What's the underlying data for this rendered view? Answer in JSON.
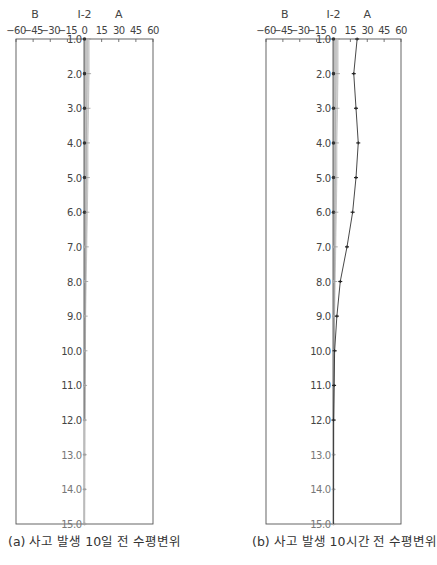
{
  "chart_data": [
    {
      "type": "line",
      "title": "(a) 사고 발생 10일 전 수평변위",
      "orientation": "vertical-profile",
      "xlabel_left": "B",
      "xlabel_center": "I-2",
      "xlabel_right": "A",
      "x_ticks": [
        "-60",
        "-45",
        "-30",
        "-15",
        "0",
        "15",
        "30",
        "45",
        "60"
      ],
      "xlim": [
        -60,
        60
      ],
      "y_ticks": [
        "1.0",
        "2.0",
        "3.0",
        "4.0",
        "5.0",
        "6.0",
        "7.0",
        "8.0",
        "9.0",
        "10.0",
        "11.0",
        "12.0",
        "13.0",
        "14.0",
        "15.0"
      ],
      "ylim": [
        1,
        15
      ],
      "ylabel": "Depth (m)",
      "depths": [
        1,
        2,
        3,
        4,
        5,
        6,
        7,
        8,
        9,
        10,
        11,
        12,
        13,
        14,
        15
      ],
      "series": [
        {
          "name": "I-2 baseline",
          "values": [
            0,
            0,
            0,
            0,
            0,
            0,
            0,
            0,
            0,
            0,
            0,
            0,
            0,
            0,
            0
          ]
        },
        {
          "name": "I-2 band",
          "values": [
            4,
            4,
            3.5,
            3,
            3,
            2.5,
            2,
            1.5,
            1,
            0.8,
            0.5,
            0.3,
            0.2,
            0.1,
            0
          ]
        }
      ]
    },
    {
      "type": "line",
      "title": "(b) 사고 발생 10시간 전 수평변위",
      "orientation": "vertical-profile",
      "xlabel_left": "B",
      "xlabel_center": "I-2",
      "xlabel_right": "A",
      "x_ticks": [
        "-60",
        "-45",
        "-30",
        "-15",
        "0",
        "15",
        "30",
        "45",
        "60"
      ],
      "xlim": [
        -60,
        60
      ],
      "y_ticks": [
        "1.0",
        "2.0",
        "3.0",
        "4.0",
        "5.0",
        "6.0",
        "7.0",
        "8.0",
        "9.0",
        "10.0",
        "11.0",
        "12.0",
        "13.0",
        "14.0",
        "15.0"
      ],
      "ylim": [
        1,
        15
      ],
      "ylabel": "Depth (m)",
      "depths": [
        1,
        2,
        3,
        4,
        5,
        6,
        7,
        8,
        9,
        10,
        11,
        12,
        13,
        14,
        15
      ],
      "series": [
        {
          "name": "I-2 baseline",
          "values": [
            0,
            0,
            0,
            0,
            0,
            0,
            0,
            0,
            0,
            0,
            0,
            0,
            0,
            0,
            0
          ]
        },
        {
          "name": "I-2 band",
          "values": [
            4,
            4,
            3.5,
            3,
            3,
            2.5,
            2,
            1.5,
            1,
            0.8,
            0.5,
            0.3,
            0.2,
            0.1,
            0
          ]
        },
        {
          "name": "10 hours before",
          "values": [
            21,
            18,
            20,
            22,
            20,
            17,
            12,
            6,
            3,
            1,
            0.5,
            0,
            0,
            0,
            0
          ]
        }
      ]
    }
  ],
  "captions": {
    "a": "(a) 사고 발생 10일 전 수평변위",
    "b": "(b) 사고 발생 10시간 전 수평변위",
    "figure": "그림 ... (truncated)"
  },
  "axis": {
    "left_label": "B",
    "center_label": "I-2",
    "right_label": "A"
  },
  "colors": {
    "axis": "#555555",
    "band": "#bdbdbd",
    "band_dark": "#888888",
    "series_b": "#333333"
  }
}
